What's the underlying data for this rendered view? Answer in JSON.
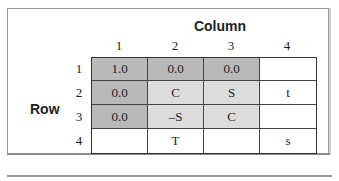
{
  "column_title": "Column",
  "row_title": "Row",
  "column_headers": [
    "1",
    "2",
    "3",
    "4"
  ],
  "row_headers": [
    "1",
    "2",
    "3",
    "4"
  ],
  "cells": [
    [
      {
        "text": "1.0",
        "shade": "dark"
      },
      {
        "text": "0.0",
        "shade": "dark"
      },
      {
        "text": "0.0",
        "shade": "dark"
      },
      {
        "text": "",
        "shade": "white"
      }
    ],
    [
      {
        "text": "0.0",
        "shade": "dark"
      },
      {
        "text": "C",
        "shade": "light"
      },
      {
        "text": "S",
        "shade": "light"
      },
      {
        "text": "t",
        "shade": "white"
      }
    ],
    [
      {
        "text": "0.0",
        "shade": "dark"
      },
      {
        "text": "–S",
        "shade": "light"
      },
      {
        "text": "C",
        "shade": "light"
      },
      {
        "text": "",
        "shade": "white"
      }
    ],
    [
      {
        "text": "",
        "shade": "white"
      },
      {
        "text": "T",
        "shade": "white"
      },
      {
        "text": "",
        "shade": "white"
      },
      {
        "text": "s",
        "shade": "white"
      }
    ]
  ],
  "colors": {
    "dark_cell": "#b9b9b9",
    "light_cell": "#dcdcdc",
    "white_cell": "#ffffff",
    "grid_line": "#333333"
  }
}
